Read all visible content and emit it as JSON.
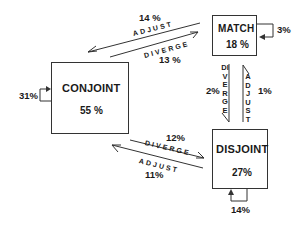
{
  "diagram": {
    "nodes": {
      "conjoint": {
        "label": "CONJOINT",
        "percent": "55 %",
        "self_loop": "31%"
      },
      "match": {
        "label": "MATCH",
        "percent": "18 %",
        "self_loop": "3%"
      },
      "disjoint": {
        "label": "DISJOINT",
        "percent": "27%",
        "self_loop": "14%"
      }
    },
    "edges": {
      "match_to_conjoint": {
        "action": "ADJUST",
        "percent": "14 %"
      },
      "conjoint_to_match": {
        "action": "DIVERGE",
        "percent": "13 %"
      },
      "match_to_disjoint": {
        "action": "DIVERGE",
        "percent": "2%"
      },
      "disjoint_to_match": {
        "action": "ADJUST",
        "percent": "1%"
      },
      "conjoint_to_disjoint": {
        "action": "DIVERGE",
        "percent": "12%"
      },
      "disjoint_to_conjoint": {
        "action": "ADJUST",
        "percent": "11%"
      }
    },
    "colors": {
      "line": "#333333",
      "text": "#1a1a1a",
      "background": "#ffffff"
    }
  }
}
